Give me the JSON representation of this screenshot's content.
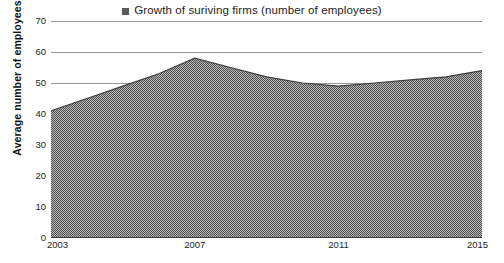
{
  "chart_data": {
    "type": "area",
    "title": "",
    "xlabel": "",
    "ylabel": "Average number of employees",
    "legend_label": "Growth of suriving firms (number of employees)",
    "legend_position": "top-center",
    "legend_marker_icon": "square-marker-icon",
    "series_color": "#7a7a7a",
    "series_outline_color": "#3d3d3d",
    "grid": true,
    "gridline_color": "#9a9a9a",
    "ylim": [
      0,
      70
    ],
    "yticks": [
      70,
      60,
      50,
      40,
      30,
      20,
      10,
      0
    ],
    "xticks": [
      "2003",
      "2007",
      "2011",
      "2015"
    ],
    "xlim": [
      2003,
      2015
    ],
    "x": [
      2003,
      2004,
      2005,
      2006,
      2007,
      2008,
      2009,
      2010,
      2011,
      2012,
      2013,
      2014,
      2015
    ],
    "series": [
      {
        "name": "Growth of suriving firms (number of employees)",
        "values": [
          41,
          45,
          49,
          53,
          58,
          55,
          52,
          50,
          49,
          50,
          51,
          52,
          54
        ]
      }
    ]
  }
}
